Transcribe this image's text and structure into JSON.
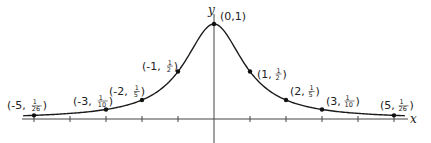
{
  "chart_data": {
    "type": "line",
    "title": "",
    "function": "y = 1/(1+x^2)",
    "xlabel": "x",
    "ylabel": "y",
    "xlim": [
      -5.5,
      5.5
    ],
    "ylim": [
      0,
      1
    ],
    "grid": false,
    "x_ticks": [
      -5,
      -4,
      -3,
      -2,
      -1,
      0,
      1,
      2,
      3,
      4,
      5
    ],
    "points": [
      {
        "x": -5,
        "y": "1/26",
        "label_main": "(-5,",
        "num": "1",
        "den": "26"
      },
      {
        "x": -3,
        "y": "1/10",
        "label_main": "(-3,",
        "num": "1",
        "den": "10"
      },
      {
        "x": -2,
        "y": "1/5",
        "label_main": "(-2,",
        "num": "1",
        "den": "5"
      },
      {
        "x": -1,
        "y": "1/2",
        "label_main": "(-1,",
        "num": "1",
        "den": "2"
      },
      {
        "x": 0,
        "y": "1",
        "label_full": "(0,1)"
      },
      {
        "x": 1,
        "y": "1/2",
        "label_main": "(1,",
        "num": "1",
        "den": "2"
      },
      {
        "x": 2,
        "y": "1/5",
        "label_main": "(2,",
        "num": "1",
        "den": "5"
      },
      {
        "x": 3,
        "y": "1/10",
        "label_main": "(3,",
        "num": "1",
        "den": "10"
      },
      {
        "x": 5,
        "y": "1/26",
        "label_main": "(5,",
        "num": "1",
        "den": "26"
      }
    ],
    "colors": {
      "curve": "#1a1a1a",
      "axis": "#333333"
    }
  },
  "axes": {
    "x_label": "x",
    "y_label": "y"
  }
}
